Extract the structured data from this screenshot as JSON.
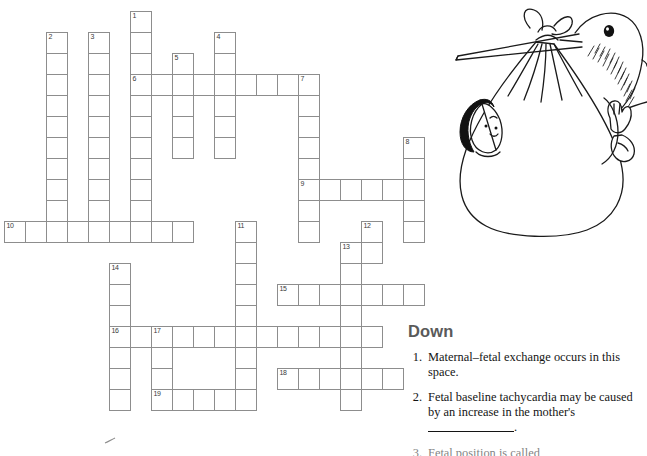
{
  "page": {
    "width": 647,
    "height": 456,
    "background": "#ffffff",
    "grid_line_color": "#8d8d8d",
    "number_color": "#3a3a3a",
    "heading_color": "#5a5a5a",
    "text_color": "#141414"
  },
  "illustration": {
    "name": "stork-carrying-baby-bundle",
    "description": "Line drawing of a stork holding a tied cloth bundle in its beak; a baby's head peeks out of the left side of the bundle and a baby's hand and foot out of the right side."
  },
  "clues": {
    "heading": "Down",
    "items": [
      {
        "number": "1.",
        "text": "Maternal–fetal exchange occurs in this space.",
        "has_blank": false
      },
      {
        "number": "2.",
        "text": "Fetal baseline tachycardia may be caused by an increase in the mother's",
        "has_blank": true,
        "blank_suffix": "."
      },
      {
        "number": "3.",
        "text": "Fetal position is called",
        "has_blank": false,
        "cut_off": true
      }
    ]
  },
  "crossword": {
    "cell_size": 21,
    "origin_x": 4,
    "origin_y": 11,
    "entries_across": [
      {
        "number": "6",
        "col": 6,
        "row": 3,
        "length": 9
      },
      {
        "number": "9",
        "col": 14,
        "row": 8,
        "length": 5
      },
      {
        "number": "10",
        "col": 0,
        "row": 10,
        "length": 9
      },
      {
        "number": "15",
        "col": 13,
        "row": 13,
        "length": 7
      },
      {
        "number": "16",
        "col": 5,
        "row": 15,
        "length": 13
      },
      {
        "number": "18",
        "col": 13,
        "row": 17,
        "length": 6
      },
      {
        "number": "19",
        "col": 7,
        "row": 18,
        "length": 5
      }
    ],
    "entries_down": [
      {
        "number": "1",
        "col": 6,
        "row": 0,
        "length": 11
      },
      {
        "number": "2",
        "col": 2,
        "row": 1,
        "length": 10
      },
      {
        "number": "3",
        "col": 4,
        "row": 1,
        "length": 10
      },
      {
        "number": "4",
        "col": 10,
        "row": 1,
        "length": 6
      },
      {
        "number": "5",
        "col": 8,
        "row": 2,
        "length": 5
      },
      {
        "number": "7",
        "col": 14,
        "row": 3,
        "length": 8
      },
      {
        "number": "8",
        "col": 19,
        "row": 6,
        "length": 5
      },
      {
        "number": "11",
        "col": 11,
        "row": 10,
        "length": 8
      },
      {
        "number": "12",
        "col": 17,
        "row": 10,
        "length": 2
      },
      {
        "number": "13",
        "col": 16,
        "row": 11,
        "length": 8
      },
      {
        "number": "14",
        "col": 5,
        "row": 12,
        "length": 7
      },
      {
        "number": "17",
        "col": 7,
        "row": 15,
        "length": 4
      }
    ]
  }
}
